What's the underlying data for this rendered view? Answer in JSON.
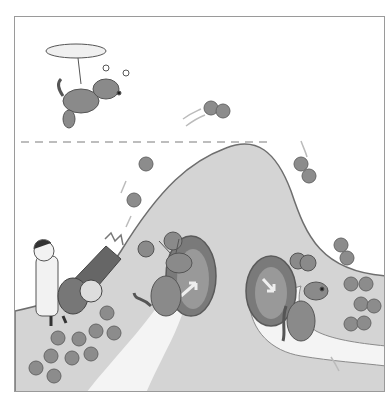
{
  "illustration": {
    "description": "Cartoon: scientist fires cannonballs (paired/single spheres) up a hill; antenna-dogs pass through tunnels in the hill; a propeller dog flies above a dashed energy line",
    "colors": {
      "hill": "#d4d4d4",
      "outline": "#6e6e6e",
      "ball": "#8c8c8c",
      "dog": "#8a8a8a",
      "tunnel": "#7a7a7a",
      "path": "#f4f4f4",
      "frame": "#9a9a9a"
    },
    "elements": [
      "flying-propeller-dog",
      "dashed-energy-line",
      "hill",
      "scientist",
      "cannon",
      "cannonball-pile",
      "flying-cannonballs",
      "tunnel-left",
      "tunnel-right",
      "dog-left",
      "dog-right",
      "ball-pairs-right"
    ]
  }
}
